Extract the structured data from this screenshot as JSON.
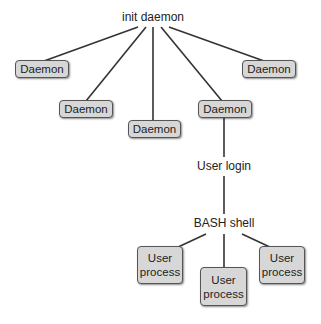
{
  "diagram": {
    "root": "init daemon",
    "daemons": [
      "Daemon",
      "Daemon",
      "Daemon",
      "Daemon",
      "Daemon"
    ],
    "login": "User login",
    "shell": "BASH shell",
    "processes": [
      {
        "line1": "User",
        "line2": "process"
      },
      {
        "line1": "User",
        "line2": "process"
      },
      {
        "line1": "User",
        "line2": "process"
      }
    ]
  }
}
